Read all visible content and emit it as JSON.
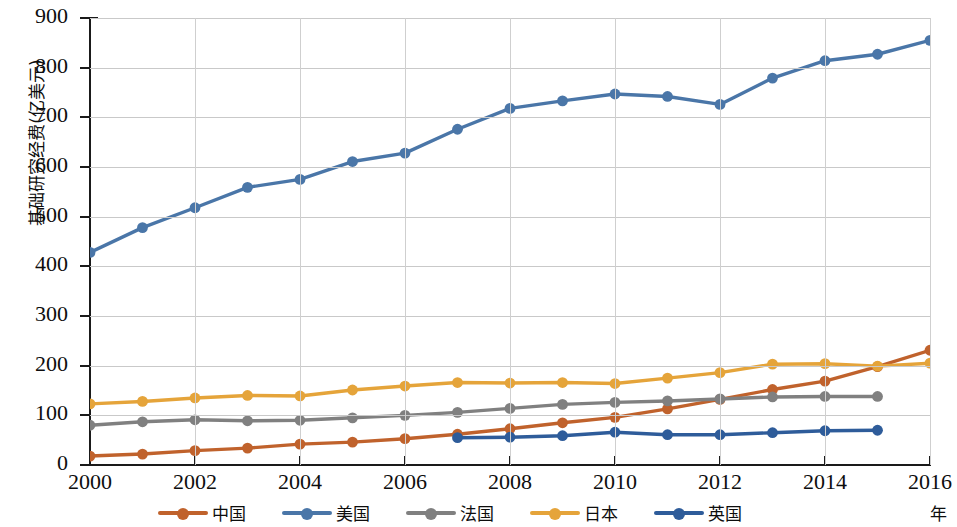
{
  "chart_data": {
    "type": "line",
    "title": "",
    "xlabel": "年",
    "ylabel": "基础研究经费(亿美元)",
    "xlim": [
      2000,
      2016
    ],
    "ylim": [
      0,
      900
    ],
    "ytick_step": 100,
    "xtick_step": 2,
    "grid": true,
    "legend_position": "bottom",
    "x": [
      2000,
      2001,
      2002,
      2003,
      2004,
      2005,
      2006,
      2007,
      2008,
      2009,
      2010,
      2011,
      2012,
      2013,
      2014,
      2015,
      2016
    ],
    "xticklabels": [
      "2000",
      "2002",
      "2004",
      "2006",
      "2008",
      "2010",
      "2012",
      "2014",
      "2016"
    ],
    "yticklabels": [
      "0",
      "100",
      "200",
      "300",
      "400",
      "500",
      "600",
      "700",
      "800",
      "900"
    ],
    "series": [
      {
        "name": "中国",
        "color": "#C0622C",
        "x": [
          2000,
          2001,
          2002,
          2003,
          2004,
          2005,
          2006,
          2007,
          2008,
          2009,
          2010,
          2011,
          2012,
          2013,
          2014,
          2015,
          2016
        ],
        "values": [
          18,
          22,
          29,
          34,
          42,
          46,
          53,
          62,
          73,
          85,
          96,
          113,
          132,
          152,
          169,
          198,
          231
        ]
      },
      {
        "name": "美国",
        "color": "#4A76A8",
        "x": [
          2000,
          2001,
          2002,
          2003,
          2004,
          2005,
          2006,
          2007,
          2008,
          2009,
          2010,
          2011,
          2012,
          2013,
          2014,
          2015,
          2016
        ],
        "values": [
          428,
          478,
          518,
          559,
          575,
          611,
          628,
          676,
          718,
          733,
          747,
          742,
          726,
          779,
          814,
          827,
          855
        ]
      },
      {
        "name": "法国",
        "color": "#808080",
        "x": [
          2000,
          2001,
          2002,
          2003,
          2004,
          2005,
          2006,
          2007,
          2008,
          2009,
          2010,
          2011,
          2012,
          2013,
          2014,
          2015
        ],
        "values": [
          80,
          87,
          91,
          89,
          90,
          95,
          100,
          106,
          114,
          122,
          126,
          129,
          133,
          137,
          138,
          138
        ]
      },
      {
        "name": "日本",
        "color": "#E5A43A",
        "x": [
          2000,
          2001,
          2002,
          2003,
          2004,
          2005,
          2006,
          2007,
          2008,
          2009,
          2010,
          2011,
          2012,
          2013,
          2014,
          2015,
          2016
        ],
        "values": [
          123,
          128,
          135,
          140,
          139,
          151,
          159,
          166,
          165,
          166,
          164,
          175,
          186,
          203,
          204,
          199,
          205
        ]
      },
      {
        "name": "英国",
        "color": "#2E5C9A",
        "x": [
          2007,
          2008,
          2009,
          2010,
          2011,
          2012,
          2013,
          2014,
          2015
        ],
        "values": [
          55,
          56,
          59,
          66,
          61,
          61,
          65,
          69,
          70
        ]
      }
    ]
  },
  "legend": {
    "items": [
      {
        "label": "中国",
        "color": "#C0622C"
      },
      {
        "label": "美国",
        "color": "#4A76A8"
      },
      {
        "label": "法国",
        "color": "#808080"
      },
      {
        "label": "日本",
        "color": "#E5A43A"
      },
      {
        "label": "英国",
        "color": "#2E5C9A"
      }
    ]
  }
}
